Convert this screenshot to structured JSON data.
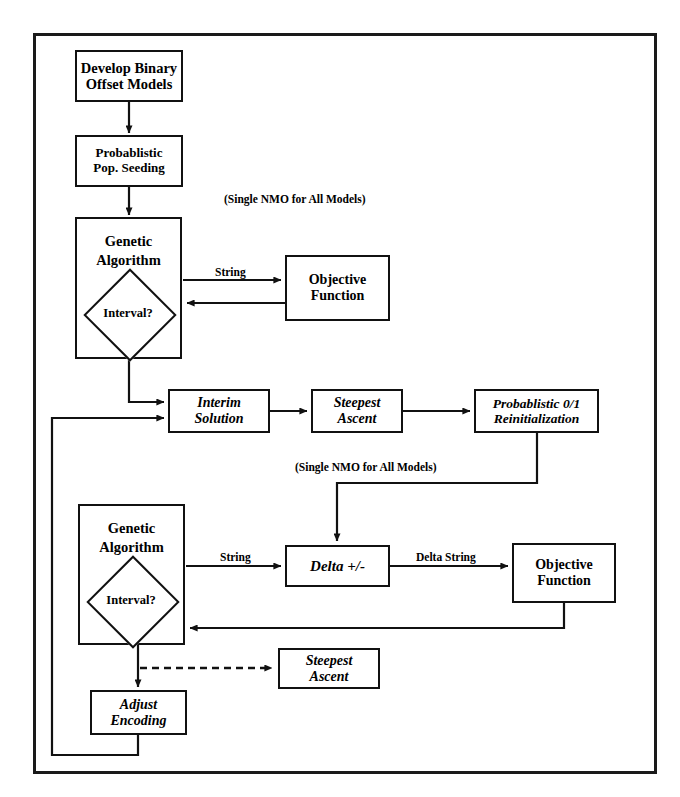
{
  "diagram": {
    "frame": {
      "x": 33,
      "y": 33,
      "width": 624,
      "height": 741
    },
    "ink_color": "#111111",
    "background_color": "#ffffff"
  },
  "nodes": {
    "develop_binary_offset_models": {
      "line1": "Develop Binary",
      "line2": "Offset Models",
      "x": 75,
      "y": 50,
      "width": 108,
      "height": 52,
      "style": "bold"
    },
    "probablistic_pop_seeding": {
      "line1": "Probablistic",
      "line2": "Pop. Seeding",
      "x": 75,
      "y": 135,
      "width": 108,
      "height": 52,
      "style": "bold"
    },
    "genetic_algorithm_top": {
      "line1": "Genetic",
      "line2": "Algorithm",
      "x": 75,
      "y": 217,
      "width": 107,
      "height": 142,
      "style": "bold"
    },
    "interval_diamond_top": {
      "label": "Interval?",
      "cx": 128,
      "cy": 313
    },
    "objective_function_top": {
      "line1": "Objective",
      "line2": "Function",
      "x": 285,
      "y": 255,
      "width": 105,
      "height": 66,
      "style": "bold"
    },
    "interim_solution": {
      "line1": "Interim",
      "line2": "Solution",
      "x": 168,
      "y": 389,
      "width": 102,
      "height": 44,
      "style": "italic-bold"
    },
    "steepest_ascent_mid": {
      "line1": "Steepest",
      "line2": "Ascent",
      "x": 311,
      "y": 389,
      "width": 92,
      "height": 44,
      "style": "italic-bold"
    },
    "probablistic_01_reinitialization": {
      "line1": "Probablistic 0/1",
      "line2": "Reinitialization",
      "x": 474,
      "y": 389,
      "width": 125,
      "height": 44,
      "style": "italic-bold"
    },
    "genetic_algorithm_bottom": {
      "line1": "Genetic",
      "line2": "Algorithm",
      "x": 78,
      "y": 504,
      "width": 107,
      "height": 141,
      "style": "bold"
    },
    "interval_diamond_bottom": {
      "label": "Interval?",
      "cx": 131,
      "cy": 600
    },
    "delta_plus_minus": {
      "line1": "Delta +/-",
      "line2": "",
      "x": 285,
      "y": 545,
      "width": 105,
      "height": 42,
      "style": "italic-bold"
    },
    "objective_function_bottom": {
      "line1": "Objective",
      "line2": "Function",
      "x": 512,
      "y": 543,
      "width": 104,
      "height": 60,
      "style": "bold"
    },
    "steepest_ascent_bottom": {
      "line1": "Steepest",
      "line2": "Ascent",
      "x": 278,
      "y": 648,
      "width": 102,
      "height": 41,
      "style": "italic-bold"
    },
    "adjust_encoding": {
      "line1": "Adjust",
      "line2": "Encoding",
      "x": 90,
      "y": 690,
      "width": 97,
      "height": 45,
      "style": "italic-bold"
    }
  },
  "edge_labels": {
    "string_top": {
      "text": "String",
      "x": 213,
      "y": 266
    },
    "string_bottom": {
      "text": "String",
      "x": 218,
      "y": 551
    },
    "delta_string": {
      "text": "Delta String",
      "x": 414,
      "y": 551
    }
  },
  "annotations": {
    "nmo_top": {
      "text": "(Single NMO for All Models)",
      "x": 224,
      "y": 193
    },
    "nmo_bottom": {
      "text": "(Single NMO for All Models)",
      "x": 295,
      "y": 461
    }
  },
  "edges": [
    {
      "name": "develop-to-seeding",
      "type": "solid-arrow",
      "note": "vertical down"
    },
    {
      "name": "seeding-to-ga-top",
      "type": "solid-arrow",
      "note": "vertical down"
    },
    {
      "name": "ga-top-to-objective-top",
      "type": "solid-arrow",
      "label": "String"
    },
    {
      "name": "objective-top-to-ga-top",
      "type": "solid-arrow",
      "note": "return left"
    },
    {
      "name": "ga-top-to-interim",
      "type": "solid-arrow",
      "note": "down then right"
    },
    {
      "name": "interim-to-steepest-mid",
      "type": "solid-arrow"
    },
    {
      "name": "steepest-mid-to-reinit",
      "type": "solid-arrow"
    },
    {
      "name": "reinit-to-delta",
      "type": "solid-arrow",
      "note": "down, left, down into Delta +/-"
    },
    {
      "name": "ga-bottom-to-delta",
      "type": "solid-arrow",
      "label": "String"
    },
    {
      "name": "delta-to-objective-bottom",
      "type": "solid-arrow",
      "label": "Delta String"
    },
    {
      "name": "objective-bottom-to-ga-bottom",
      "type": "solid-arrow",
      "note": "down then left return"
    },
    {
      "name": "ga-bottom-to-steepest-bottom",
      "type": "dashed-arrow"
    },
    {
      "name": "ga-bottom-to-adjust-encoding",
      "type": "solid-arrow",
      "note": "vertical down"
    },
    {
      "name": "adjust-encoding-to-interim",
      "type": "solid-arrow",
      "note": "down, left, up, right into Interim Solution"
    }
  ]
}
